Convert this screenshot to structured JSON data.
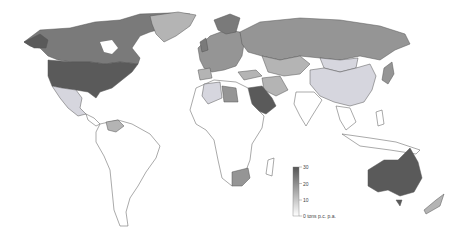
{
  "map": {
    "type": "choropleth",
    "subject": "CO2 emissions per capita",
    "colors": {
      "very_high": "#5a5a5a",
      "high": "#7a7a7a",
      "medium_high": "#959595",
      "medium": "#b4b4b4",
      "low": "#d6d6de",
      "very_low": "#ffffff",
      "border": "#555555"
    },
    "legend": {
      "unit_label": "tons p.c. p.a.",
      "ticks": [
        "0",
        "10",
        "20",
        "30"
      ],
      "min": 0,
      "max": 30,
      "zero_label": "0 tons p.c. p.a."
    },
    "regions": [
      {
        "name": "United States",
        "level": "very_high"
      },
      {
        "name": "Canada",
        "level": "high"
      },
      {
        "name": "Greenland",
        "level": "medium"
      },
      {
        "name": "Mexico",
        "level": "low"
      },
      {
        "name": "South America",
        "level": "very_low"
      },
      {
        "name": "Venezuela",
        "level": "medium"
      },
      {
        "name": "Europe",
        "level": "medium_high"
      },
      {
        "name": "Russia",
        "level": "medium_high"
      },
      {
        "name": "Kazakhstan",
        "level": "medium"
      },
      {
        "name": "Saudi Arabia",
        "level": "very_high"
      },
      {
        "name": "Libya",
        "level": "medium"
      },
      {
        "name": "Iran",
        "level": "medium"
      },
      {
        "name": "China",
        "level": "low"
      },
      {
        "name": "Mongolia",
        "level": "low"
      },
      {
        "name": "Japan",
        "level": "medium_high"
      },
      {
        "name": "Africa",
        "level": "very_low"
      },
      {
        "name": "South Africa",
        "level": "medium"
      },
      {
        "name": "India",
        "level": "very_low"
      },
      {
        "name": "Southeast Asia",
        "level": "very_low"
      },
      {
        "name": "Australia",
        "level": "very_high"
      },
      {
        "name": "New Zealand",
        "level": "medium"
      }
    ]
  }
}
